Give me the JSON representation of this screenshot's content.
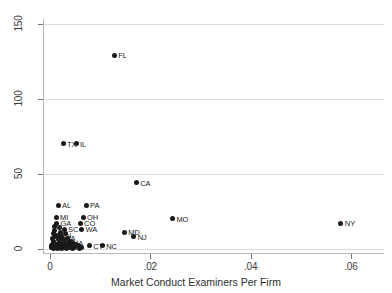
{
  "chart_data": {
    "type": "scatter",
    "title": "",
    "xlabel": "Market Conduct Examiners Per Firm",
    "ylabel": "",
    "xlim": [
      -0.0012,
      0.0666
    ],
    "ylim": [
      -3,
      153
    ],
    "grid": true,
    "legend": "none",
    "xticks": [
      "0",
      ".02",
      ".04",
      ".06"
    ],
    "xtickvalues": [
      0,
      0.02,
      0.04,
      0.06
    ],
    "yticks": [
      "0",
      "50",
      "100",
      "150"
    ],
    "ytickvalues": [
      0,
      50,
      100,
      150
    ],
    "points": [
      {
        "label": "FL",
        "x": 0.0128,
        "y": 129
      },
      {
        "label": "TX",
        "x": 0.0026,
        "y": 70
      },
      {
        "label": "IL",
        "x": 0.0052,
        "y": 70
      },
      {
        "label": "CA",
        "x": 0.0172,
        "y": 44
      },
      {
        "label": "AL",
        "x": 0.0016,
        "y": 29
      },
      {
        "label": "PA",
        "x": 0.0072,
        "y": 29
      },
      {
        "label": "MI",
        "x": 0.0012,
        "y": 21
      },
      {
        "label": "OH",
        "x": 0.0066,
        "y": 21
      },
      {
        "label": "MO",
        "x": 0.0244,
        "y": 20
      },
      {
        "label": "GA",
        "x": 0.0013,
        "y": 17
      },
      {
        "label": "CO",
        "x": 0.006,
        "y": 17
      },
      {
        "label": "SC",
        "x": 0.0028,
        "y": 13
      },
      {
        "label": "WA",
        "x": 0.0063,
        "y": 13
      },
      {
        "label": "MD",
        "x": 0.0148,
        "y": 11
      },
      {
        "label": "NJ",
        "x": 0.0167,
        "y": 8
      },
      {
        "label": "IN",
        "x": 0.002,
        "y": 9
      },
      {
        "label": "VA",
        "x": 0.0024,
        "y": 7
      },
      {
        "label": "MA",
        "x": 0.0036,
        "y": 4
      },
      {
        "label": "CT",
        "x": 0.0078,
        "y": 2
      },
      {
        "label": "NC",
        "x": 0.0104,
        "y": 2
      },
      {
        "label": "NY",
        "x": 0.058,
        "y": 17
      },
      {
        "label": "",
        "x": 0.0008,
        "y": 15
      },
      {
        "label": "",
        "x": 0.0018,
        "y": 14
      },
      {
        "label": "",
        "x": 0.0009,
        "y": 12
      },
      {
        "label": "",
        "x": 0.0021,
        "y": 11
      },
      {
        "label": "",
        "x": 0.0006,
        "y": 10
      },
      {
        "label": "",
        "x": 0.0014,
        "y": 9
      },
      {
        "label": "",
        "x": 0.003,
        "y": 10
      },
      {
        "label": "",
        "x": 0.001,
        "y": 8
      },
      {
        "label": "",
        "x": 0.0022,
        "y": 8
      },
      {
        "label": "",
        "x": 0.0034,
        "y": 7
      },
      {
        "label": "",
        "x": 0.0005,
        "y": 7
      },
      {
        "label": "",
        "x": 0.0016,
        "y": 6
      },
      {
        "label": "",
        "x": 0.0027,
        "y": 6
      },
      {
        "label": "",
        "x": 0.004,
        "y": 5
      },
      {
        "label": "",
        "x": 0.0007,
        "y": 5
      },
      {
        "label": "",
        "x": 0.0018,
        "y": 4
      },
      {
        "label": "",
        "x": 0.0029,
        "y": 4
      },
      {
        "label": "",
        "x": 0.0044,
        "y": 4
      },
      {
        "label": "",
        "x": 0.0004,
        "y": 3
      },
      {
        "label": "",
        "x": 0.0013,
        "y": 3
      },
      {
        "label": "",
        "x": 0.0024,
        "y": 3
      },
      {
        "label": "",
        "x": 0.0036,
        "y": 3
      },
      {
        "label": "",
        "x": 0.005,
        "y": 3
      },
      {
        "label": "",
        "x": 0.0003,
        "y": 2
      },
      {
        "label": "",
        "x": 0.0011,
        "y": 2
      },
      {
        "label": "",
        "x": 0.002,
        "y": 2
      },
      {
        "label": "",
        "x": 0.0031,
        "y": 2
      },
      {
        "label": "",
        "x": 0.0042,
        "y": 2
      },
      {
        "label": "",
        "x": 0.0056,
        "y": 2
      },
      {
        "label": "",
        "x": 0.0002,
        "y": 1
      },
      {
        "label": "",
        "x": 0.0009,
        "y": 1
      },
      {
        "label": "",
        "x": 0.0017,
        "y": 1
      },
      {
        "label": "",
        "x": 0.0026,
        "y": 1
      },
      {
        "label": "",
        "x": 0.0038,
        "y": 1
      },
      {
        "label": "",
        "x": 0.0048,
        "y": 1
      },
      {
        "label": "",
        "x": 0.0062,
        "y": 1
      },
      {
        "label": "",
        "x": 0.0006,
        "y": 0
      },
      {
        "label": "",
        "x": 0.0014,
        "y": 0
      },
      {
        "label": "",
        "x": 0.0023,
        "y": 0
      },
      {
        "label": "",
        "x": 0.0033,
        "y": 0
      },
      {
        "label": "",
        "x": 0.0045,
        "y": 0
      },
      {
        "label": "",
        "x": 0.0058,
        "y": 0
      }
    ]
  }
}
